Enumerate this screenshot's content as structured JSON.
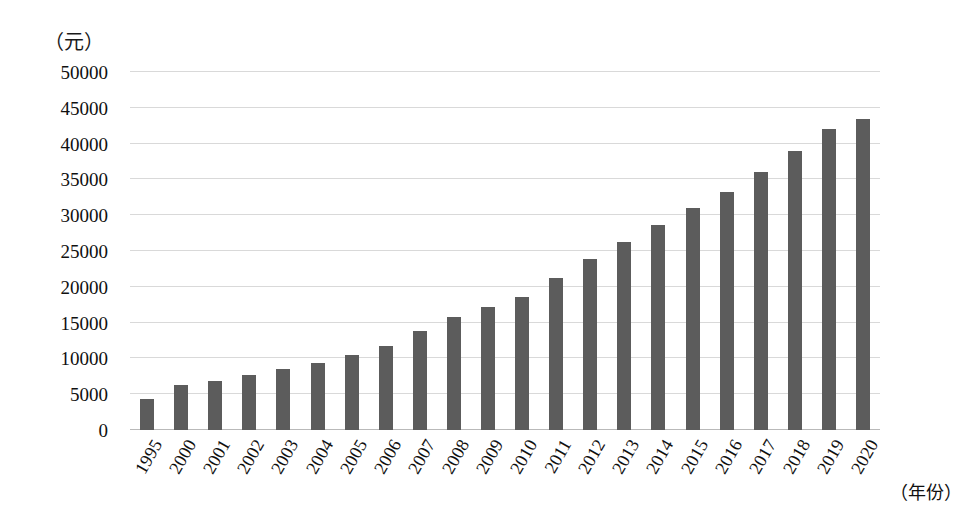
{
  "chart_data": {
    "type": "bar",
    "title": "",
    "subtitle": "",
    "xlabel": "（年份）",
    "ylabel": "（元）",
    "ylim": [
      0,
      50000
    ],
    "grid": true,
    "legend": "none",
    "bar_color": "#5c5c5c",
    "categories": [
      "1995",
      "2000",
      "2001",
      "2002",
      "2003",
      "2004",
      "2005",
      "2006",
      "2007",
      "2008",
      "2009",
      "2010",
      "2011",
      "2012",
      "2013",
      "2014",
      "2015",
      "2016",
      "2017",
      "2018",
      "2019",
      "2020"
    ],
    "values": [
      4300,
      6280,
      6860,
      7700,
      8470,
      9420,
      10490,
      11760,
      13790,
      15780,
      17175,
      18600,
      21300,
      23900,
      26300,
      28600,
      31000,
      33200,
      36000,
      39000,
      42000,
      43500
    ],
    "y_ticks": [
      50000,
      45000,
      40000,
      35000,
      30000,
      25000,
      20000,
      15000,
      10000,
      5000,
      0
    ],
    "y_tick_labels": [
      "50000",
      "45000",
      "40000",
      "35000",
      "30000",
      "25000",
      "20000",
      "15000",
      "10000",
      "5000",
      "0"
    ]
  }
}
